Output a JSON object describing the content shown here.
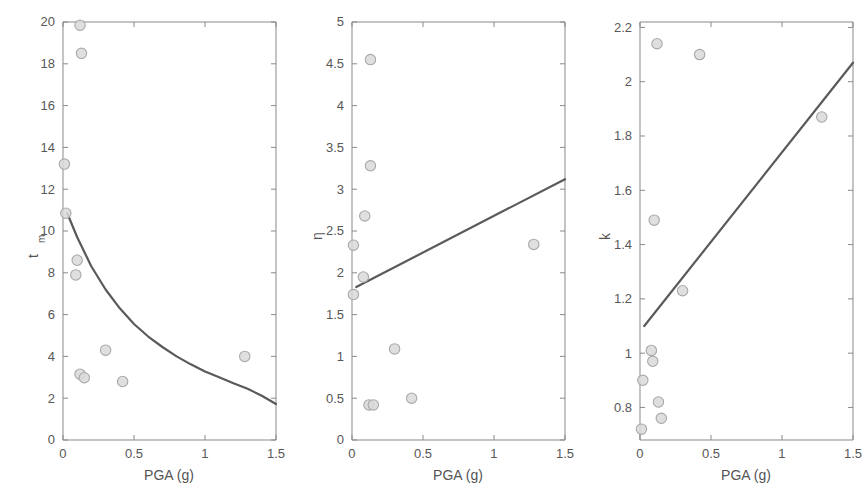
{
  "figure": {
    "panel_count": 3,
    "background_color": "#ffffff",
    "marker_fill": "#d9d9d9",
    "marker_stroke": "#a8a8a8",
    "line_color": "#5a5a5a",
    "axis_color": "#8a8a8a"
  },
  "chart_data": [
    {
      "type": "scatter",
      "title": "",
      "xlabel": "PGA (g)",
      "ylabel": "t",
      "ylabel_sub": "m",
      "xlim": [
        0,
        1.5
      ],
      "ylim": [
        0,
        20
      ],
      "xticks": [
        0,
        0.5,
        1,
        1.5
      ],
      "xticklabels": [
        "0",
        "0.5",
        "1",
        "1.5"
      ],
      "yticks": [
        0,
        2,
        4,
        6,
        8,
        10,
        12,
        14,
        16,
        18,
        20
      ],
      "yticklabels": [
        "0",
        "2",
        "4",
        "6",
        "8",
        "10",
        "12",
        "14",
        "16",
        "18",
        "20"
      ],
      "grid": false,
      "legend": "none",
      "points": [
        {
          "x": 0.12,
          "y": 19.85
        },
        {
          "x": 0.13,
          "y": 18.5
        },
        {
          "x": 0.01,
          "y": 13.2
        },
        {
          "x": 0.02,
          "y": 10.85
        },
        {
          "x": 0.1,
          "y": 8.6
        },
        {
          "x": 0.09,
          "y": 7.9
        },
        {
          "x": 0.3,
          "y": 4.3
        },
        {
          "x": 0.12,
          "y": 3.15
        },
        {
          "x": 0.15,
          "y": 2.98
        },
        {
          "x": 0.42,
          "y": 2.8
        },
        {
          "x": 1.28,
          "y": 4.0
        }
      ],
      "fit_curve": {
        "kind": "decaying",
        "x": [
          0.03,
          0.1,
          0.2,
          0.3,
          0.4,
          0.5,
          0.6,
          0.7,
          0.8,
          0.9,
          1.0,
          1.1,
          1.2,
          1.3,
          1.4,
          1.5
        ],
        "y": [
          10.85,
          9.7,
          8.3,
          7.2,
          6.3,
          5.55,
          4.95,
          4.45,
          4.0,
          3.62,
          3.28,
          3.0,
          2.72,
          2.45,
          2.12,
          1.72
        ]
      }
    },
    {
      "type": "scatter",
      "title": "",
      "xlabel": "PGA (g)",
      "ylabel": "η",
      "ylabel_sub": "",
      "xlim": [
        0,
        1.5
      ],
      "ylim": [
        0,
        5
      ],
      "xticks": [
        0,
        0.5,
        1,
        1.5
      ],
      "xticklabels": [
        "0",
        "0.5",
        "1",
        "1.5"
      ],
      "yticks": [
        0,
        0.5,
        1,
        1.5,
        2,
        2.5,
        3,
        3.5,
        4,
        4.5,
        5
      ],
      "yticklabels": [
        "0",
        "0.5",
        "1",
        "1.5",
        "2",
        "2.5",
        "3",
        "3.5",
        "4",
        "4.5",
        "5"
      ],
      "grid": false,
      "legend": "none",
      "points": [
        {
          "x": 0.13,
          "y": 4.55
        },
        {
          "x": 0.13,
          "y": 3.28
        },
        {
          "x": 0.09,
          "y": 2.68
        },
        {
          "x": 0.01,
          "y": 2.33
        },
        {
          "x": 0.08,
          "y": 1.95
        },
        {
          "x": 0.01,
          "y": 1.74
        },
        {
          "x": 0.3,
          "y": 1.09
        },
        {
          "x": 0.42,
          "y": 0.5
        },
        {
          "x": 0.12,
          "y": 0.42
        },
        {
          "x": 0.15,
          "y": 0.42
        },
        {
          "x": 1.28,
          "y": 2.34
        }
      ],
      "fit_curve": {
        "kind": "linear",
        "x": [
          0.03,
          1.5
        ],
        "y": [
          1.83,
          3.12
        ]
      }
    },
    {
      "type": "scatter",
      "title": "",
      "xlabel": "PGA (g)",
      "ylabel": "k",
      "ylabel_sub": "",
      "xlim": [
        0,
        1.5
      ],
      "ylim": [
        0.68,
        2.22
      ],
      "xticks": [
        0,
        0.5,
        1,
        1.5
      ],
      "xticklabels": [
        "0",
        "0.5",
        "1",
        "1.5"
      ],
      "yticks": [
        0.8,
        1,
        1.2,
        1.4,
        1.6,
        1.8,
        2,
        2.2
      ],
      "yticklabels": [
        "0.8",
        "1",
        "1.2",
        "1.4",
        "1.6",
        "1.8",
        "2",
        "2.2"
      ],
      "grid": false,
      "legend": "none",
      "points": [
        {
          "x": 0.12,
          "y": 2.14
        },
        {
          "x": 0.42,
          "y": 2.1
        },
        {
          "x": 1.28,
          "y": 1.87
        },
        {
          "x": 0.1,
          "y": 1.49
        },
        {
          "x": 0.3,
          "y": 1.23
        },
        {
          "x": 0.08,
          "y": 1.01
        },
        {
          "x": 0.09,
          "y": 0.97
        },
        {
          "x": 0.02,
          "y": 0.9
        },
        {
          "x": 0.13,
          "y": 0.82
        },
        {
          "x": 0.15,
          "y": 0.76
        },
        {
          "x": 0.01,
          "y": 0.72
        }
      ],
      "fit_curve": {
        "kind": "linear",
        "x": [
          0.03,
          1.5
        ],
        "y": [
          1.1,
          2.07
        ]
      }
    }
  ]
}
